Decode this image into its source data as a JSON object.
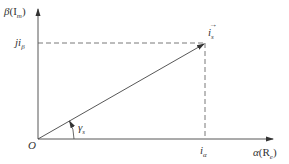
{
  "diagram": {
    "colors": {
      "line": "#333333",
      "dash": "#555555",
      "background": "#ffffff"
    },
    "axes": {
      "y_label_main": "β",
      "y_label_paren": "(I",
      "y_label_sub": "m",
      "y_label_close": ")",
      "x_label_main": "α",
      "x_label_paren": "(R",
      "x_label_sub": "e",
      "x_label_close": ")"
    },
    "origin_label": "O",
    "vector_label_main": "i",
    "vector_label_sub": "s",
    "vector_arrow": "→",
    "angle_label_main": "γ",
    "angle_label_sub": "s",
    "beta_projection_prefix": "j",
    "beta_projection_main": "i",
    "beta_projection_sub": "β",
    "alpha_projection_main": "i",
    "alpha_projection_sub": "α"
  }
}
